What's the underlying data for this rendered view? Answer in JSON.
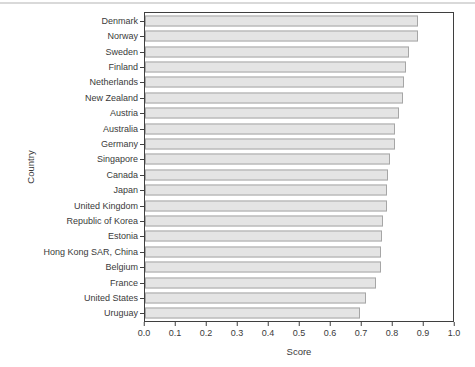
{
  "page": {
    "top_rule_color": "#d9d9d9",
    "background_color": "#ffffff"
  },
  "chart_data": {
    "type": "bar",
    "orientation": "horizontal",
    "title": "",
    "xlabel": "Score",
    "ylabel": "Country",
    "xlim": [
      0.0,
      1.0
    ],
    "x_tick_labels": [
      "0.0",
      "0.1",
      "0.2",
      "0.3",
      "0.4",
      "0.5",
      "0.6",
      "0.7",
      "0.8",
      "0.9",
      "1.0"
    ],
    "grid": "off",
    "legend": "none",
    "frame": "full-box",
    "categories": [
      "Denmark",
      "Norway",
      "Sweden",
      "Finland",
      "Netherlands",
      "New Zealand",
      "Austria",
      "Australia",
      "Germany",
      "Singapore",
      "Canada",
      "Japan",
      "United Kingdom",
      "Republic of Korea",
      "Estonia",
      "Hong Kong SAR, China",
      "Belgium",
      "France",
      "United States",
      "Uruguay"
    ],
    "values": [
      0.887,
      0.885,
      0.858,
      0.847,
      0.84,
      0.838,
      0.824,
      0.813,
      0.811,
      0.795,
      0.788,
      0.787,
      0.786,
      0.774,
      0.768,
      0.767,
      0.766,
      0.751,
      0.718,
      0.697
    ],
    "bar_fill_color": "#e4e4e4",
    "bar_border_color": "#a6a6a6",
    "axis_color": "#3f3f3f",
    "text_color": "#3a3a3a"
  }
}
